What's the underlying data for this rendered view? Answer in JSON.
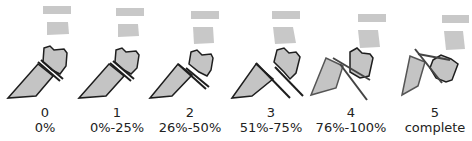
{
  "title": "",
  "colors": {
    "bone_fill": "#c4c4c4",
    "vertebra_fill": "#c8c8c8",
    "outline": "#1e1e1e",
    "line_dark": "#333333",
    "line_gray": "#555555",
    "text": "#222222"
  },
  "stages": [
    {
      "grade": "0",
      "range": "0%"
    },
    {
      "grade": "1",
      "range": "0%-25%"
    },
    {
      "grade": "2",
      "range": "26%-50%"
    },
    {
      "grade": "3",
      "range": "51%-75%"
    },
    {
      "grade": "4",
      "range": "76%-100%"
    },
    {
      "grade": "5",
      "range": "complete"
    }
  ]
}
